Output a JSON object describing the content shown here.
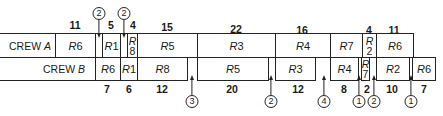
{
  "crews": [
    {
      "label": "CREW A",
      "label_name": "CREW",
      "label_letter": "A",
      "tasks": [
        {
          "task": "R6",
          "duration": "11",
          "x0": 55,
          "x1": 95
        },
        {
          "task": "R1",
          "duration": "5",
          "x0": 102,
          "x1": 120
        },
        {
          "task": "R8",
          "duration": "4",
          "x0": 127,
          "x1": 137,
          "stacked": true
        },
        {
          "task": "R5",
          "duration": "15",
          "x0": 137,
          "x1": 197
        },
        {
          "task": "R3",
          "duration": "22",
          "x0": 197,
          "x1": 275
        },
        {
          "task": "R4",
          "duration": "16",
          "x0": 275,
          "x1": 330
        },
        {
          "task": "R7",
          "duration": "",
          "x0": 330,
          "x1": 362
        },
        {
          "task": "R2",
          "duration": "4",
          "x0": 362,
          "x1": 376,
          "stacked": true
        },
        {
          "task": "R6",
          "duration": "11",
          "x0": 376,
          "x1": 413
        }
      ],
      "waits": [
        {
          "value": "2",
          "x": 99
        },
        {
          "value": "2",
          "x": 124
        }
      ]
    },
    {
      "label": "CREW B",
      "label_name": "CREW",
      "label_letter": "B",
      "tasks": [
        {
          "task": "R6",
          "duration": "7",
          "x0": 95,
          "x1": 120
        },
        {
          "task": "R1",
          "duration": "6",
          "x0": 120,
          "x1": 137
        },
        {
          "task": "R8",
          "duration": "12",
          "x0": 137,
          "x1": 187
        },
        {
          "task": "R5",
          "duration": "20",
          "x0": 197,
          "x1": 268
        },
        {
          "task": "R3",
          "duration": "12",
          "x0": 275,
          "x1": 315
        },
        {
          "task": "R4",
          "duration": "8",
          "x0": 330,
          "x1": 358
        },
        {
          "task": "R7",
          "duration": "2",
          "x0": 361,
          "x1": 369,
          "stacked": true
        },
        {
          "task": "R2",
          "duration": "10",
          "x0": 376,
          "x1": 409
        },
        {
          "task": "R6",
          "duration": "7",
          "x0": 412,
          "x1": 435
        }
      ],
      "waits": [
        {
          "value": "3",
          "x": 192
        },
        {
          "value": "2",
          "x": 271
        },
        {
          "value": "4",
          "x": 324
        },
        {
          "value": "1",
          "x": 359
        },
        {
          "value": "2",
          "x": 374
        },
        {
          "value": "1",
          "x": 411
        }
      ]
    }
  ],
  "labels": {
    "crew_a_name": "CREW",
    "crew_a_letter": "A",
    "crew_b_name": "CREW",
    "crew_b_letter": "B",
    "a_r6_1": {
      "r": "R",
      "n": "6",
      "dur": "11"
    },
    "a_r1": {
      "r": "R",
      "n": "1",
      "dur": "5"
    },
    "a_r8": {
      "r": "R",
      "n": "8",
      "dur": "4"
    },
    "a_r5": {
      "r": "R",
      "n": "5",
      "dur": "15"
    },
    "a_r3": {
      "r": "R",
      "n": "3",
      "dur": "22"
    },
    "a_r4": {
      "r": "R",
      "n": "4",
      "dur": "16"
    },
    "a_r7": {
      "r": "R",
      "n": "7"
    },
    "a_r2": {
      "r": "R",
      "n": "2",
      "dur": "4"
    },
    "a_r6_2": {
      "r": "R",
      "n": "6",
      "dur": "11"
    },
    "b_r6_1": {
      "r": "R",
      "n": "6",
      "dur": "7"
    },
    "b_r1": {
      "r": "R",
      "n": "1",
      "dur": "6"
    },
    "b_r8": {
      "r": "R",
      "n": "8",
      "dur": "12"
    },
    "b_r5": {
      "r": "R",
      "n": "5",
      "dur": "20"
    },
    "b_r3": {
      "r": "R",
      "n": "3",
      "dur": "12"
    },
    "b_r4": {
      "r": "R",
      "n": "4",
      "dur": "8"
    },
    "b_r7": {
      "r": "R",
      "n": "7",
      "dur": "2"
    },
    "b_r2": {
      "r": "R",
      "n": "2",
      "dur": "10"
    },
    "b_r6_2": {
      "r": "R",
      "n": "6",
      "dur": "7"
    },
    "waits_top": [
      "2",
      "2"
    ],
    "waits_bottom": [
      "3",
      "2",
      "4",
      "1",
      "2",
      "1"
    ]
  }
}
